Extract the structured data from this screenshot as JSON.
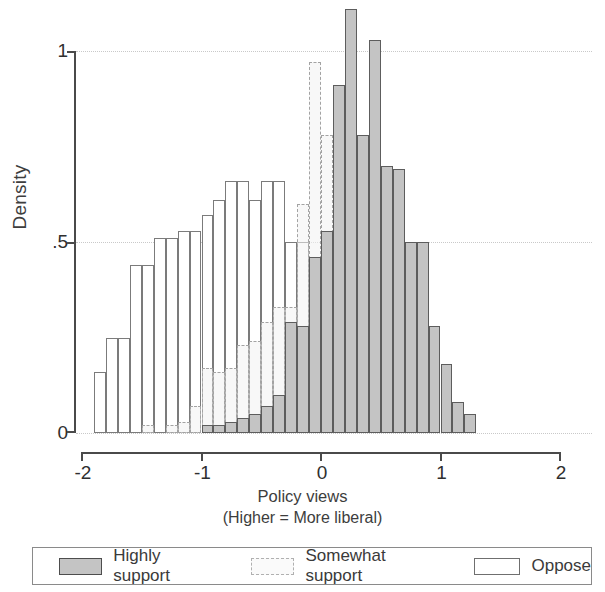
{
  "chart_data": {
    "type": "bar",
    "title": "",
    "xlabel": "Policy views",
    "xlabel_sub": "(Higher = More liberal)",
    "ylabel": "Density",
    "xlim": [
      -2,
      2
    ],
    "ylim": [
      0,
      1.15
    ],
    "xticks": [
      -2,
      -1,
      0,
      1,
      2
    ],
    "xtick_labels": [
      "-2",
      "-1",
      "0",
      "1",
      "2"
    ],
    "yticks": [
      0,
      0.5,
      1
    ],
    "ytick_labels": [
      "0",
      ".5",
      "1"
    ],
    "grid": "horizontal-dotted",
    "legend_position": "bottom",
    "bin_width": 0.1,
    "series": [
      {
        "name": "Oppose",
        "style": "white-solid-outline",
        "color": "#ffffff",
        "edge_color": "#7b7b7b",
        "bins": [
          -1.85,
          -1.75,
          -1.65,
          -1.55,
          -1.45,
          -1.35,
          -1.25,
          -1.15,
          -1.05,
          -0.95,
          -0.85,
          -0.75,
          -0.65,
          -0.55,
          -0.45,
          -0.35,
          -0.25,
          -0.15,
          -0.05,
          0.05,
          0.15,
          0.25,
          0.35,
          0.45,
          0.55,
          0.65,
          0.75,
          0.85,
          0.95,
          1.05
        ],
        "values": [
          0.16,
          0.25,
          0.25,
          0.44,
          0.44,
          0.51,
          0.51,
          0.53,
          0.53,
          0.57,
          0.61,
          0.66,
          0.66,
          0.61,
          0.66,
          0.66,
          0.5,
          0.5,
          0.44,
          0.45,
          0.41,
          0.29,
          0.2,
          0.15,
          0.1,
          0.06,
          0.04,
          0.03,
          0.02,
          0.01
        ]
      },
      {
        "name": "Somewhat support",
        "style": "light-dashed-outline",
        "color": "#f3f3f3",
        "edge_color": "#a3a3a3",
        "bins": [
          -1.45,
          -1.25,
          -1.15,
          -1.05,
          -0.95,
          -0.85,
          -0.75,
          -0.65,
          -0.55,
          -0.45,
          -0.35,
          -0.25,
          -0.15,
          -0.05,
          0.05,
          0.15,
          0.25,
          0.35,
          0.45,
          0.55,
          0.65,
          0.75,
          0.85,
          0.95,
          1.05,
          1.15
        ],
        "values": [
          0.02,
          0.02,
          0.03,
          0.07,
          0.17,
          0.16,
          0.17,
          0.23,
          0.24,
          0.29,
          0.33,
          0.33,
          0.6,
          0.97,
          0.78,
          0.74,
          0.74,
          0.78,
          0.78,
          0.6,
          0.44,
          0.23,
          0.13,
          0.07,
          0.04,
          0.02
        ]
      },
      {
        "name": "Highly support",
        "style": "gray-fill-solid-outline",
        "color": "#c4c4c4",
        "edge_color": "#5d5d5d",
        "bins": [
          -0.95,
          -0.85,
          -0.75,
          -0.65,
          -0.55,
          -0.45,
          -0.35,
          -0.25,
          -0.15,
          -0.05,
          0.05,
          0.15,
          0.25,
          0.35,
          0.45,
          0.55,
          0.65,
          0.75,
          0.85,
          0.95,
          1.05,
          1.15,
          1.25
        ],
        "values": [
          0.02,
          0.02,
          0.03,
          0.04,
          0.05,
          0.07,
          0.1,
          0.29,
          0.28,
          0.46,
          0.53,
          0.91,
          1.11,
          0.78,
          1.03,
          0.7,
          0.69,
          0.5,
          0.5,
          0.28,
          0.18,
          0.08,
          0.05
        ]
      }
    ]
  },
  "legend": {
    "items": [
      {
        "label": "Highly support",
        "swatch": "gray-fill-solid-outline"
      },
      {
        "label": "Somewhat support",
        "swatch": "light-dashed-outline"
      },
      {
        "label": "Oppose",
        "swatch": "white-solid-outline"
      }
    ]
  }
}
